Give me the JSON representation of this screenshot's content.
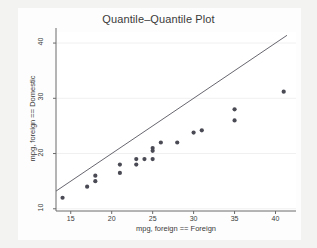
{
  "chart_data": {
    "type": "scatter",
    "title": "Quantile–Quantile Plot",
    "xlabel": "mpg, foreign == Foreign",
    "ylabel": "mpg, foreign == Domestic",
    "xlim": [
      13.2,
      42.5
    ],
    "ylim": [
      9.6,
      42.0
    ],
    "xticks": [
      15,
      20,
      25,
      30,
      35,
      40
    ],
    "yticks": [
      10,
      20,
      30,
      40
    ],
    "xtick_labels": [
      "15",
      "20",
      "25",
      "30",
      "35",
      "40"
    ],
    "ytick_labels": [
      "10",
      "20",
      "30",
      "40"
    ],
    "grid": "faint horizontal gridlines at y ticks",
    "legend": "none",
    "marker_color": "#4a4a55",
    "line_color": "#55555f",
    "axis_color": "#6a6a6a",
    "plot_background": "#ffffff",
    "figure_background": "#f3f3f2",
    "series": [
      {
        "name": "quantile-points",
        "type": "scatter",
        "points": [
          [
            14,
            12
          ],
          [
            17,
            14
          ],
          [
            18,
            16
          ],
          [
            18,
            15
          ],
          [
            21,
            18
          ],
          [
            21,
            16.5
          ],
          [
            23,
            19
          ],
          [
            23,
            18
          ],
          [
            24,
            19
          ],
          [
            25,
            21
          ],
          [
            25,
            20.5
          ],
          [
            25,
            19
          ],
          [
            26,
            22
          ],
          [
            28,
            22
          ],
          [
            30,
            23.8
          ],
          [
            31,
            24.2
          ],
          [
            35,
            28
          ],
          [
            35,
            26
          ],
          [
            41,
            31.2
          ]
        ]
      },
      {
        "name": "reference-line",
        "type": "line",
        "x": [
          13.2,
          41.4
        ],
        "y": [
          13.2,
          41.4
        ],
        "description": "45-degree identity reference line"
      }
    ]
  }
}
